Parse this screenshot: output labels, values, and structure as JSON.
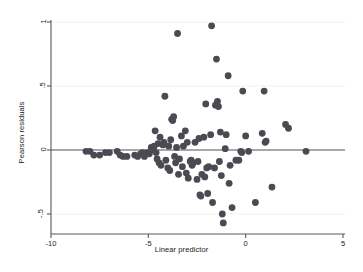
{
  "chart_data": {
    "type": "scatter",
    "title": "",
    "xlabel": "Linear predictor",
    "ylabel": "Pearson residuals",
    "xlim": [
      -10.6,
      5.7
    ],
    "ylim": [
      -0.62,
      1.06
    ],
    "xticks": [
      -10,
      -5,
      0,
      5
    ],
    "xtick_labels": [
      "-10",
      "-5",
      "0",
      "5"
    ],
    "yticks": [
      1,
      0.5,
      0,
      -0.5
    ],
    "ytick_labels": [
      "1",
      ".5",
      "0",
      "-.5"
    ],
    "grid": false,
    "reference_line": {
      "orientation": "horizontal",
      "y": 0
    },
    "marker": {
      "shape": "circle",
      "size": 3.4,
      "color": "#4a4a52"
    },
    "legend": null,
    "points": [
      [
        -8.2,
        -0.01
      ],
      [
        -8.0,
        -0.01
      ],
      [
        -7.8,
        -0.04
      ],
      [
        -7.5,
        -0.04
      ],
      [
        -7.2,
        -0.02
      ],
      [
        -7.0,
        -0.02
      ],
      [
        -6.6,
        -0.01
      ],
      [
        -6.45,
        -0.04
      ],
      [
        -6.3,
        -0.05
      ],
      [
        -6.1,
        -0.05
      ],
      [
        -5.7,
        -0.04
      ],
      [
        -5.55,
        -0.05
      ],
      [
        -5.4,
        -0.03
      ],
      [
        -5.3,
        -0.02
      ],
      [
        -5.2,
        -0.05
      ],
      [
        -5.05,
        -0.02
      ],
      [
        -4.95,
        -0.03
      ],
      [
        -4.85,
        0.02
      ],
      [
        -4.8,
        0.01
      ],
      [
        -4.75,
        0.0
      ],
      [
        -4.7,
        0.03
      ],
      [
        -4.65,
        0.15
      ],
      [
        -4.6,
        -0.02
      ],
      [
        -4.55,
        -0.07
      ],
      [
        -4.5,
        0.05
      ],
      [
        -4.45,
        -0.1
      ],
      [
        -4.4,
        0.1
      ],
      [
        -4.35,
        -0.12
      ],
      [
        -4.25,
        0.04
      ],
      [
        -4.2,
        0.06
      ],
      [
        -4.15,
        0.42
      ],
      [
        -4.1,
        -0.08
      ],
      [
        -4.0,
        -0.14
      ],
      [
        -3.95,
        0.03
      ],
      [
        -3.9,
        -0.16
      ],
      [
        -3.85,
        0.08
      ],
      [
        -3.8,
        0.24
      ],
      [
        -3.75,
        0.23
      ],
      [
        -3.7,
        0.26
      ],
      [
        -3.65,
        -0.05
      ],
      [
        -3.6,
        -0.1
      ],
      [
        -3.55,
        0.02
      ],
      [
        -3.5,
        0.91
      ],
      [
        -3.45,
        -0.19
      ],
      [
        -3.4,
        -0.07
      ],
      [
        -3.3,
        0.11
      ],
      [
        -3.25,
        -0.13
      ],
      [
        -3.2,
        0.03
      ],
      [
        -3.1,
        0.15
      ],
      [
        -3.05,
        -0.18
      ],
      [
        -3.0,
        0.06
      ],
      [
        -2.95,
        -0.22
      ],
      [
        -2.85,
        -0.09
      ],
      [
        -2.8,
        -0.08
      ],
      [
        -2.75,
        -0.12
      ],
      [
        -2.7,
        -0.1
      ],
      [
        -2.6,
        0.06
      ],
      [
        -2.5,
        -0.23
      ],
      [
        -2.45,
        -0.09
      ],
      [
        -2.4,
        0.09
      ],
      [
        -2.35,
        -0.35
      ],
      [
        -2.3,
        -0.36
      ],
      [
        -2.25,
        -0.19
      ],
      [
        -2.15,
        0.1
      ],
      [
        -2.1,
        -0.21
      ],
      [
        -2.05,
        0.36
      ],
      [
        -2.0,
        -0.14
      ],
      [
        -1.95,
        -0.34
      ],
      [
        -1.9,
        -0.13
      ],
      [
        -1.8,
        0.12
      ],
      [
        -1.75,
        0.97
      ],
      [
        -1.7,
        -0.41
      ],
      [
        -1.6,
        -0.14
      ],
      [
        -1.55,
        0.35
      ],
      [
        -1.5,
        0.71
      ],
      [
        -1.45,
        0.38
      ],
      [
        -1.4,
        0.34
      ],
      [
        -1.35,
        -0.09
      ],
      [
        -1.3,
        0.14
      ],
      [
        -1.25,
        -0.2
      ],
      [
        -1.2,
        -0.5
      ],
      [
        -1.15,
        -0.57
      ],
      [
        -1.05,
        0.01
      ],
      [
        -1.0,
        0.12
      ],
      [
        -0.9,
        0.58
      ],
      [
        -0.85,
        -0.26
      ],
      [
        -0.8,
        -0.12
      ],
      [
        -0.7,
        -0.45
      ],
      [
        -0.5,
        -0.08
      ],
      [
        -0.35,
        -0.08
      ],
      [
        -0.25,
        -0.01
      ],
      [
        -0.2,
        -0.02
      ],
      [
        -0.15,
        0.46
      ],
      [
        0.0,
        0.11
      ],
      [
        0.15,
        -0.01
      ],
      [
        0.5,
        -0.41
      ],
      [
        0.85,
        0.13
      ],
      [
        0.95,
        0.46
      ],
      [
        1.0,
        0.06
      ],
      [
        1.05,
        0.07
      ],
      [
        1.35,
        -0.29
      ],
      [
        2.05,
        0.2
      ],
      [
        2.2,
        0.17
      ],
      [
        3.1,
        -0.01
      ]
    ]
  },
  "axes": {
    "x_title": "Linear predictor",
    "y_title": "Pearson residuals",
    "x_tick_labels": [
      "-10",
      "-5",
      "0",
      "5"
    ],
    "y_tick_labels": [
      "1",
      ".5",
      "0",
      "-.5"
    ]
  },
  "style": {
    "marker_color": "#4a4a52",
    "axis_color": "#58585e",
    "text_color": "#1a1a1a",
    "background": "#ffffff"
  }
}
